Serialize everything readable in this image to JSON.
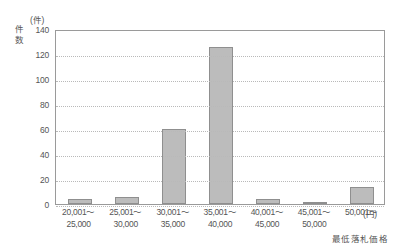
{
  "chart_data": {
    "type": "bar",
    "title": "",
    "xlabel": "最低落札価格",
    "ylabel": "件数",
    "y_unit": "(件)",
    "x_unit": "(円)",
    "categories": [
      {
        "line1": "20,001～",
        "line2": "25,000"
      },
      {
        "line1": "25,001～",
        "line2": "30,000"
      },
      {
        "line1": "30,001～",
        "line2": "35,000"
      },
      {
        "line1": "35,001～",
        "line2": "40,000"
      },
      {
        "line1": "40,001～",
        "line2": "45,000"
      },
      {
        "line1": "45,001～",
        "line2": "50,000"
      },
      {
        "line1": "50,001～",
        "line2": ""
      }
    ],
    "values": [
      4,
      6,
      60,
      126,
      4,
      1,
      14
    ],
    "ylim": [
      0,
      140
    ],
    "yticks": [
      0,
      20,
      40,
      60,
      80,
      100,
      120,
      140
    ],
    "grid": true,
    "legend": false,
    "bar_color": "#bcbcbc",
    "bar_border_color": "#8f8f8f",
    "axis_color": "#9a9a9a",
    "grid_color": "#b9b9b9",
    "text_color": "#555555"
  }
}
